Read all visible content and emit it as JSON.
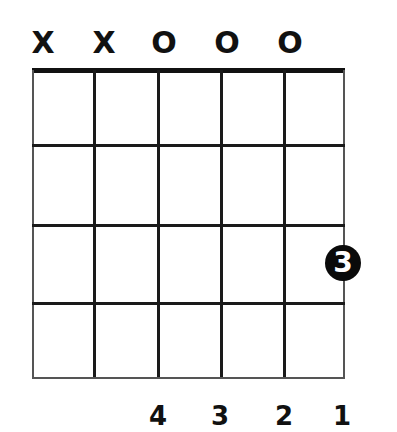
{
  "diagram": {
    "type": "guitar-chord-diagram",
    "string_markers": [
      "X",
      "X",
      "O",
      "O",
      "O"
    ],
    "frets_shown": 4,
    "strings": 6,
    "fingered_notes": [
      {
        "string": 6,
        "fret": 3,
        "finger": "3"
      }
    ],
    "finger_numbers": [
      "4",
      "3",
      "2",
      "1"
    ],
    "colors": {
      "ink": "#111111",
      "background": "#ffffff",
      "dot_text": "#ffffff"
    }
  }
}
